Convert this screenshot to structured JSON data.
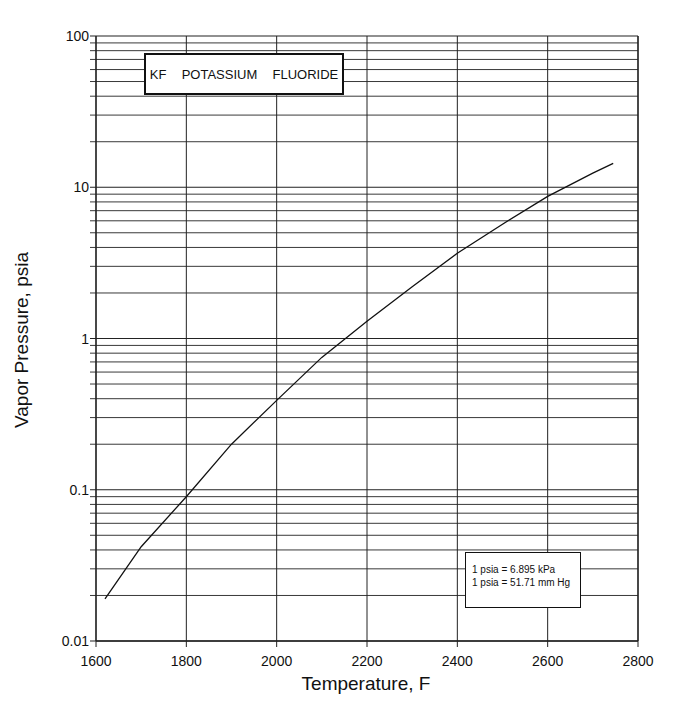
{
  "chart_data": {
    "type": "line",
    "title": "KF  POTASSIUM  FLUORIDE",
    "xlabel": "Temperature, F",
    "ylabel": "Vapor Pressure, psia",
    "xlim": [
      1600,
      2800
    ],
    "ylim": [
      0.01,
      100
    ],
    "yscale": "log",
    "grid": true,
    "x_ticks": [
      "1600",
      "1800",
      "2000",
      "2200",
      "2400",
      "2600",
      "2800"
    ],
    "y_ticks": [
      "0.01",
      "0.1",
      "1",
      "10",
      "100"
    ],
    "series": [
      {
        "name": "KF vapor pressure",
        "x": [
          1620,
          1700,
          1800,
          1900,
          2000,
          2100,
          2200,
          2300,
          2400,
          2500,
          2600,
          2700,
          2745
        ],
        "y": [
          0.019,
          0.042,
          0.09,
          0.2,
          0.39,
          0.75,
          1.3,
          2.2,
          3.66,
          5.7,
          8.7,
          12.4,
          14.4
        ]
      }
    ],
    "annotations": [
      "1 psia = 6.895 kPa",
      "1 psia = 51.71 mm Hg"
    ]
  },
  "title_box": {
    "text": "KF  POTASSIUM  FLUORIDE"
  },
  "note_box": {
    "line1": "1 psia = 6.895 kPa",
    "line2": "1 psia = 51.71 mm Hg"
  },
  "axes": {
    "xlabel": "Temperature, F",
    "ylabel": "Vapor Pressure, psia"
  }
}
